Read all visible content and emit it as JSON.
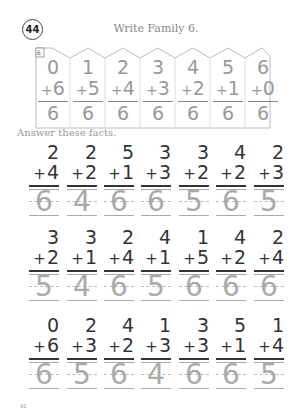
{
  "header": {
    "lesson_number": "44",
    "title": "Write Family 6."
  },
  "family": {
    "tag": "6",
    "facts": [
      {
        "top": "0",
        "addend": "6",
        "answer": "6"
      },
      {
        "top": "1",
        "addend": "5",
        "answer": "6"
      },
      {
        "top": "2",
        "addend": "4",
        "answer": "6"
      },
      {
        "top": "3",
        "addend": "3",
        "answer": "6"
      },
      {
        "top": "4",
        "addend": "2",
        "answer": "6"
      },
      {
        "top": "5",
        "addend": "1",
        "answer": "6"
      },
      {
        "top": "6",
        "addend": "0",
        "answer": "6"
      }
    ]
  },
  "instructions": "Answer these facts.",
  "plus_sign": "+",
  "problems": [
    [
      {
        "top": "2",
        "addend": "4",
        "answer": "6"
      },
      {
        "top": "2",
        "addend": "2",
        "answer": "4"
      },
      {
        "top": "5",
        "addend": "1",
        "answer": "6"
      },
      {
        "top": "3",
        "addend": "3",
        "answer": "6"
      },
      {
        "top": "3",
        "addend": "2",
        "answer": "5"
      },
      {
        "top": "4",
        "addend": "2",
        "answer": "6"
      },
      {
        "top": "2",
        "addend": "3",
        "answer": "5"
      }
    ],
    [
      {
        "top": "3",
        "addend": "2",
        "answer": "5"
      },
      {
        "top": "3",
        "addend": "1",
        "answer": "4"
      },
      {
        "top": "2",
        "addend": "4",
        "answer": "6"
      },
      {
        "top": "4",
        "addend": "1",
        "answer": "5"
      },
      {
        "top": "1",
        "addend": "5",
        "answer": "6"
      },
      {
        "top": "4",
        "addend": "2",
        "answer": "6"
      },
      {
        "top": "2",
        "addend": "4",
        "answer": "6"
      }
    ],
    [
      {
        "top": "0",
        "addend": "6",
        "answer": "6"
      },
      {
        "top": "2",
        "addend": "3",
        "answer": "5"
      },
      {
        "top": "4",
        "addend": "2",
        "answer": "6"
      },
      {
        "top": "1",
        "addend": "3",
        "answer": "4"
      },
      {
        "top": "3",
        "addend": "3",
        "answer": "6"
      },
      {
        "top": "5",
        "addend": "1",
        "answer": "6"
      },
      {
        "top": "1",
        "addend": "4",
        "answer": "5"
      }
    ]
  ],
  "footer": {
    "page_number": "92"
  }
}
